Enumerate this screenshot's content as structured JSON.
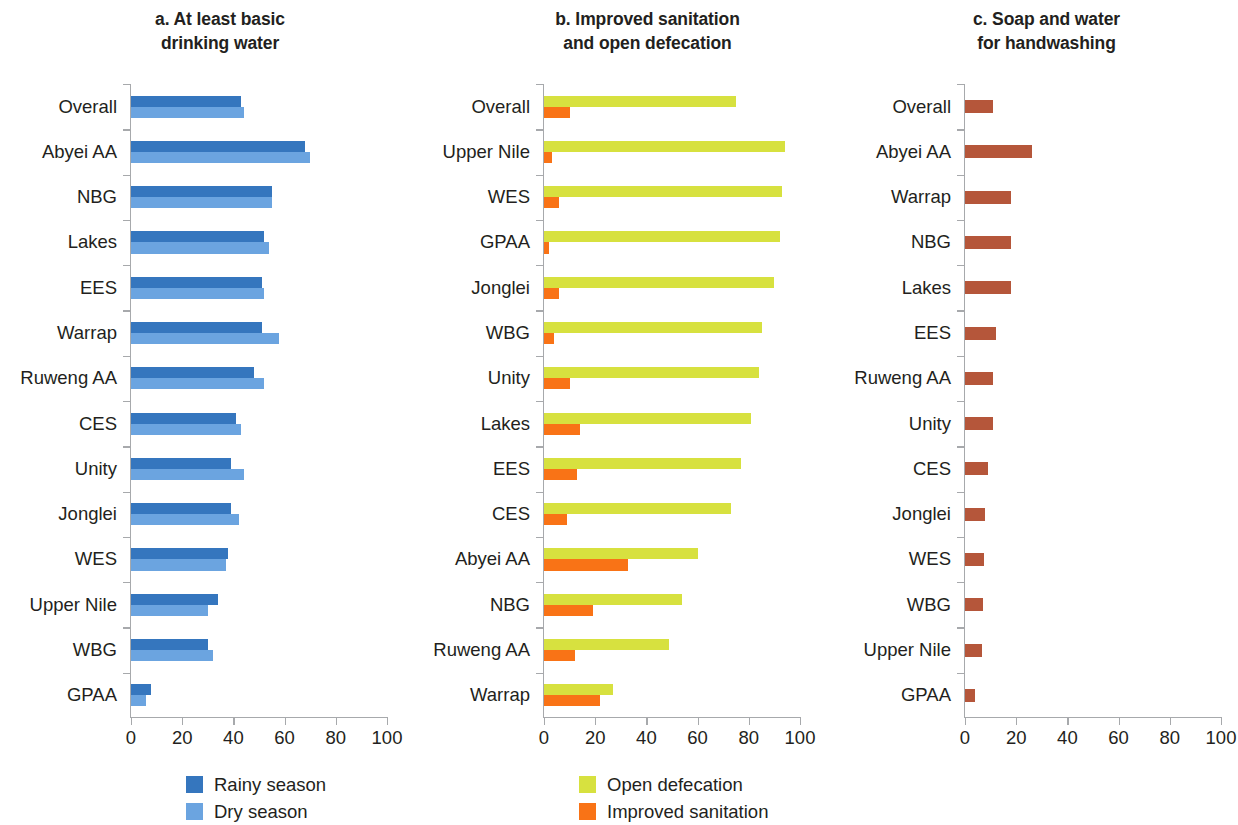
{
  "colors": {
    "rainy": "#3576be",
    "dry": "#6ba4e0",
    "open_defecation": "#d7e13f",
    "improved_sanitation": "#f97316",
    "handwashing": "#b5563a",
    "axis": "#a7a9ac",
    "text": "#231f20"
  },
  "panels": {
    "a": {
      "title_line1": "a. At least basic",
      "title_line2": "drinking water",
      "legend": [
        {
          "label": "Rainy season",
          "color": "#3576be"
        },
        {
          "label": "Dry season",
          "color": "#6ba4e0"
        }
      ]
    },
    "b": {
      "title_line1": "b. Improved sanitation",
      "title_line2": "and open defecation",
      "legend": [
        {
          "label": "Open defecation",
          "color": "#d7e13f"
        },
        {
          "label": "Improved sanitation",
          "color": "#f97316"
        }
      ]
    },
    "c": {
      "title_line1": "c. Soap and water",
      "title_line2": "for handwashing",
      "legend": []
    }
  },
  "axis_ticks": [
    "0",
    "20",
    "40",
    "60",
    "80",
    "100"
  ],
  "chart_data": [
    {
      "type": "bar",
      "orientation": "horizontal",
      "panel": "a",
      "title": "a. At least basic drinking water",
      "xlabel": "",
      "ylabel": "",
      "xlim": [
        0,
        100
      ],
      "grid": false,
      "legend_position": "bottom-left",
      "xticks": [
        0,
        20,
        40,
        60,
        80,
        100
      ],
      "categories": [
        "Overall",
        "Abyei AA",
        "NBG",
        "Lakes",
        "EES",
        "Warrap",
        "Ruweng AA",
        "CES",
        "Unity",
        "Jonglei",
        "WES",
        "Upper Nile",
        "WBG",
        "GPAA"
      ],
      "series": [
        {
          "name": "Rainy season",
          "color": "#3576be",
          "values": [
            43,
            68,
            55,
            52,
            51,
            51,
            48,
            41,
            39,
            39,
            38,
            34,
            30,
            8
          ]
        },
        {
          "name": "Dry season",
          "color": "#6ba4e0",
          "values": [
            44,
            70,
            55,
            54,
            52,
            58,
            52,
            43,
            44,
            42,
            37,
            30,
            32,
            6
          ]
        }
      ]
    },
    {
      "type": "bar",
      "orientation": "horizontal",
      "panel": "b",
      "title": "b. Improved sanitation and open defecation",
      "xlabel": "",
      "ylabel": "",
      "xlim": [
        0,
        100
      ],
      "grid": false,
      "legend_position": "bottom-left",
      "xticks": [
        0,
        20,
        40,
        60,
        80,
        100
      ],
      "categories": [
        "Overall",
        "Upper Nile",
        "WES",
        "GPAA",
        "Jonglei",
        "WBG",
        "Unity",
        "Lakes",
        "EES",
        "CES",
        "Abyei AA",
        "NBG",
        "Ruweng AA",
        "Warrap"
      ],
      "series": [
        {
          "name": "Open defecation",
          "color": "#d7e13f",
          "values": [
            75,
            94,
            93,
            92,
            90,
            85,
            84,
            81,
            77,
            73,
            60,
            54,
            49,
            27
          ]
        },
        {
          "name": "Improved sanitation",
          "color": "#f97316",
          "values": [
            10,
            3,
            6,
            2,
            6,
            4,
            10,
            14,
            13,
            9,
            33,
            19,
            12,
            22
          ]
        }
      ]
    },
    {
      "type": "bar",
      "orientation": "horizontal",
      "panel": "c",
      "title": "c. Soap and water for handwashing",
      "xlabel": "",
      "ylabel": "",
      "xlim": [
        0,
        100
      ],
      "grid": false,
      "legend_position": "none",
      "xticks": [
        0,
        20,
        40,
        60,
        80,
        100
      ],
      "categories": [
        "Overall",
        "Abyei AA",
        "Warrap",
        "NBG",
        "Lakes",
        "EES",
        "Ruweng AA",
        "Unity",
        "CES",
        "Jonglei",
        "WES",
        "WBG",
        "Upper Nile",
        "GPAA"
      ],
      "series": [
        {
          "name": "Soap and water for handwashing",
          "color": "#b5563a",
          "values": [
            11,
            26,
            18,
            18,
            18,
            12,
            11,
            11,
            9,
            8,
            7.5,
            7,
            6.5,
            4
          ]
        }
      ]
    }
  ]
}
